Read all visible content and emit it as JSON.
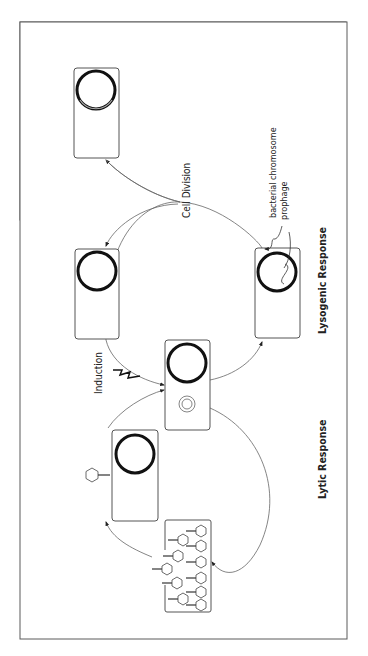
{
  "diagram": {
    "orientation": "rotated-90-ccw",
    "labels": {
      "cell_division": "Cell Division",
      "bacterial_chromosome": "bacterial chromosome",
      "prophage": "prophage",
      "lysogenic_response": "Lysogenic Response",
      "induction": "Induction",
      "lytic_response": "Lytic Response"
    },
    "nodes": [
      {
        "id": "central-cell",
        "desc": "Infected cell with chromosome and circularized phage DNA"
      },
      {
        "id": "lysogen-cell",
        "desc": "Lysogen with prophage integrated in bacterial chromosome"
      },
      {
        "id": "daughter-cell-1",
        "desc": "Daughter lysogen after cell division"
      },
      {
        "id": "daughter-cell-2",
        "desc": "Daughter lysogen after cell division"
      },
      {
        "id": "infection-cell",
        "desc": "Cell being infected by phage"
      },
      {
        "id": "lysing-cell",
        "desc": "Cell lysing, releasing progeny phages"
      }
    ],
    "edges": [
      {
        "from": "central-cell",
        "to": "lysogen-cell",
        "label": ""
      },
      {
        "from": "lysogen-cell",
        "to": "daughter-cell-1",
        "label": "Cell Division"
      },
      {
        "from": "lysogen-cell",
        "to": "daughter-cell-2",
        "label": "Cell Division"
      },
      {
        "from": "daughter-cell-1",
        "to": "central-cell",
        "label": "Induction"
      },
      {
        "from": "central-cell",
        "to": "lysing-cell",
        "label": "Lytic Response"
      },
      {
        "from": "lysing-cell",
        "to": "infection-cell",
        "label": ""
      },
      {
        "from": "infection-cell",
        "to": "central-cell",
        "label": ""
      }
    ]
  }
}
